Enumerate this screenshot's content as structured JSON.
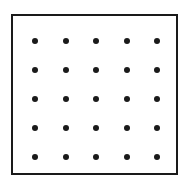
{
  "figure": {
    "canvas": {
      "width": 185,
      "height": 181,
      "background_color": "#ffffff"
    },
    "frame": {
      "shape": "square",
      "x": 11,
      "y": 14,
      "width": 167,
      "height": 161,
      "border_width": 2,
      "border_color": "#1a1a1a",
      "fill_color": "#ffffff"
    },
    "dots": {
      "rows": 5,
      "columns": 5,
      "count": 25,
      "diameter": 6,
      "color": "#1a1a1a",
      "first_center_x": 33,
      "first_center_y": 39,
      "spacing_x": 30.5,
      "spacing_y": 29
    }
  },
  "chart_data": {
    "type": "scatter",
    "title": "",
    "xlabel": "",
    "ylabel": "",
    "xlim": [
      0,
      4
    ],
    "ylim": [
      0,
      4
    ],
    "grid": false,
    "legend": "none",
    "marker": "filled-circle",
    "marker_color": "#1a1a1a",
    "marker_size": 6,
    "xtick_labels": [],
    "ytick_labels": [],
    "points": [
      {
        "x": 0,
        "y": 4
      },
      {
        "x": 1,
        "y": 4
      },
      {
        "x": 2,
        "y": 4
      },
      {
        "x": 3,
        "y": 4
      },
      {
        "x": 4,
        "y": 4
      },
      {
        "x": 0,
        "y": 3
      },
      {
        "x": 1,
        "y": 3
      },
      {
        "x": 2,
        "y": 3
      },
      {
        "x": 3,
        "y": 3
      },
      {
        "x": 4,
        "y": 3
      },
      {
        "x": 0,
        "y": 2
      },
      {
        "x": 1,
        "y": 2
      },
      {
        "x": 2,
        "y": 2
      },
      {
        "x": 3,
        "y": 2
      },
      {
        "x": 4,
        "y": 2
      },
      {
        "x": 0,
        "y": 1
      },
      {
        "x": 1,
        "y": 1
      },
      {
        "x": 2,
        "y": 1
      },
      {
        "x": 3,
        "y": 1
      },
      {
        "x": 4,
        "y": 1
      },
      {
        "x": 0,
        "y": 0
      },
      {
        "x": 1,
        "y": 0
      },
      {
        "x": 2,
        "y": 0
      },
      {
        "x": 3,
        "y": 0
      },
      {
        "x": 4,
        "y": 0
      }
    ],
    "pixel_centers": [
      {
        "x": 33,
        "y": 39
      },
      {
        "x": 63.5,
        "y": 39
      },
      {
        "x": 94,
        "y": 39
      },
      {
        "x": 124.5,
        "y": 39
      },
      {
        "x": 155,
        "y": 39
      },
      {
        "x": 33,
        "y": 68
      },
      {
        "x": 63.5,
        "y": 68
      },
      {
        "x": 94,
        "y": 68
      },
      {
        "x": 124.5,
        "y": 68
      },
      {
        "x": 155,
        "y": 68
      },
      {
        "x": 33,
        "y": 97
      },
      {
        "x": 63.5,
        "y": 97
      },
      {
        "x": 94,
        "y": 97
      },
      {
        "x": 124.5,
        "y": 97
      },
      {
        "x": 155,
        "y": 97
      },
      {
        "x": 33,
        "y": 126
      },
      {
        "x": 63.5,
        "y": 126
      },
      {
        "x": 94,
        "y": 126
      },
      {
        "x": 124.5,
        "y": 126
      },
      {
        "x": 155,
        "y": 126
      },
      {
        "x": 33,
        "y": 155
      },
      {
        "x": 63.5,
        "y": 155
      },
      {
        "x": 94,
        "y": 155
      },
      {
        "x": 124.5,
        "y": 155
      },
      {
        "x": 155,
        "y": 155
      }
    ]
  }
}
